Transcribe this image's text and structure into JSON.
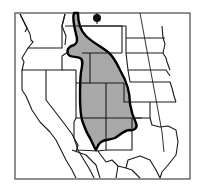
{
  "map": {
    "title": "Species range map, western United States",
    "colors": {
      "background": "#ffffff",
      "frame": "#555555",
      "borders": "#1a1a1a",
      "range_fill": "#a8a8a8",
      "range_outline": "#000000",
      "marker": "#111111"
    },
    "range_label": "range",
    "marker_label": "isolated occurrence"
  }
}
